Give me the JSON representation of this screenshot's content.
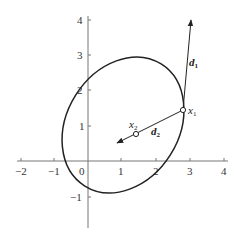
{
  "figure": {
    "x_axis": {
      "ticks": [
        {
          "value": -2,
          "label": "−2",
          "px": 21
        },
        {
          "value": -1,
          "label": "−1",
          "px": 54
        },
        {
          "value": 1,
          "label": "1",
          "px": 121
        },
        {
          "value": 2,
          "label": "2",
          "px": 156
        },
        {
          "value": 3,
          "label": "3",
          "px": 190
        },
        {
          "value": 4,
          "label": "4",
          "px": 224
        }
      ],
      "origin_label": "0"
    },
    "y_axis": {
      "ticks": [
        {
          "value": 4,
          "label": "4",
          "px": 20
        },
        {
          "value": 3,
          "label": "3",
          "px": 55
        },
        {
          "value": 2,
          "label": "2",
          "px": 90
        },
        {
          "value": 1,
          "label": "1",
          "px": 126
        },
        {
          "value": -1,
          "label": "−1",
          "px": 197
        }
      ]
    },
    "points": {
      "x1": {
        "label": "x",
        "sub": "1"
      },
      "x2": {
        "label": "x",
        "sub": "2"
      }
    },
    "directions": {
      "d1": {
        "label": "d",
        "sub": "1"
      },
      "d2": {
        "label": "d",
        "sub": "2"
      }
    },
    "colors": {
      "line": "#222222",
      "axis": "#777777"
    }
  }
}
